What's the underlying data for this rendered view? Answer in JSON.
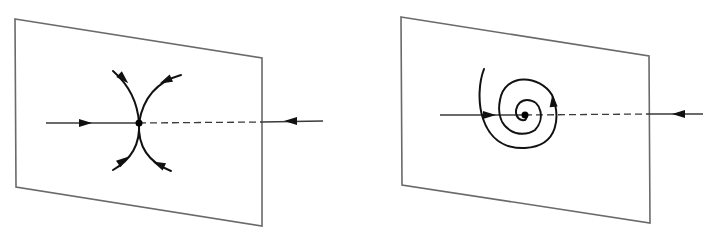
{
  "figure": {
    "panels": [
      {
        "name": "saddle-panel",
        "kind": "saddle",
        "plane": [
          [
            15,
            19
          ],
          [
            262,
            58
          ],
          [
            262,
            226
          ],
          [
            16,
            187
          ]
        ],
        "fixed_point": [
          139,
          123
        ],
        "axis_in": {
          "from": [
            46,
            123
          ],
          "to": [
            139,
            123
          ],
          "arrow_at": [
            86,
            123
          ],
          "arrow_dir": "right"
        },
        "axis_dashed": {
          "from": [
            139,
            123
          ],
          "to": [
            262,
            122
          ]
        },
        "axis_out": {
          "from": [
            262,
            122
          ],
          "to": [
            323,
            121
          ],
          "arrow_at": [
            290,
            121
          ],
          "arrow_dir": "left"
        },
        "curves": [
          {
            "d": "M113,71 Q137,92 139,123 Q141,154 113,170"
          },
          {
            "d": "M181,75 Q145,85 139,123 Q137,158 171,171"
          }
        ],
        "curve_arrows": [
          {
            "at": [
              124,
              79
            ],
            "angle": 45
          },
          {
            "at": [
              165,
              81
            ],
            "angle": 155
          },
          {
            "at": [
              124,
              160
            ],
            "angle": -35
          },
          {
            "at": [
              158,
              164
            ],
            "angle": -155
          }
        ]
      },
      {
        "name": "focus-panel",
        "kind": "spiral-focus",
        "plane": [
          [
            401,
            17
          ],
          [
            649,
            56
          ],
          [
            650,
            223
          ],
          [
            402,
            185
          ]
        ],
        "fixed_point": [
          525,
          115
        ],
        "axis_in": {
          "from": [
            440,
            115
          ],
          "to": [
            525,
            115
          ],
          "arrow_at": [
            490,
            115
          ],
          "arrow_dir": "right"
        },
        "axis_dashed": {
          "from": [
            525,
            115
          ],
          "to": [
            649,
            114
          ]
        },
        "axis_out": {
          "from": [
            649,
            114
          ],
          "to": [
            703,
            114
          ],
          "arrow_at": [
            678,
            114
          ],
          "arrow_dir": "left"
        },
        "curves": [
          {
            "d": "M484,69 C474,95 478,150 525,148 C560,146 560,115 552,95 C540,75 505,72 500,100 C494,130 520,140 535,130 C545,120 542,100 527,100 C515,100 512,118 522,120 C527,121 527,117 525,115"
          }
        ],
        "curve_arrows": [
          {
            "at": [
              553,
              100
            ],
            "angle": -95
          }
        ]
      }
    ],
    "caption": ""
  }
}
